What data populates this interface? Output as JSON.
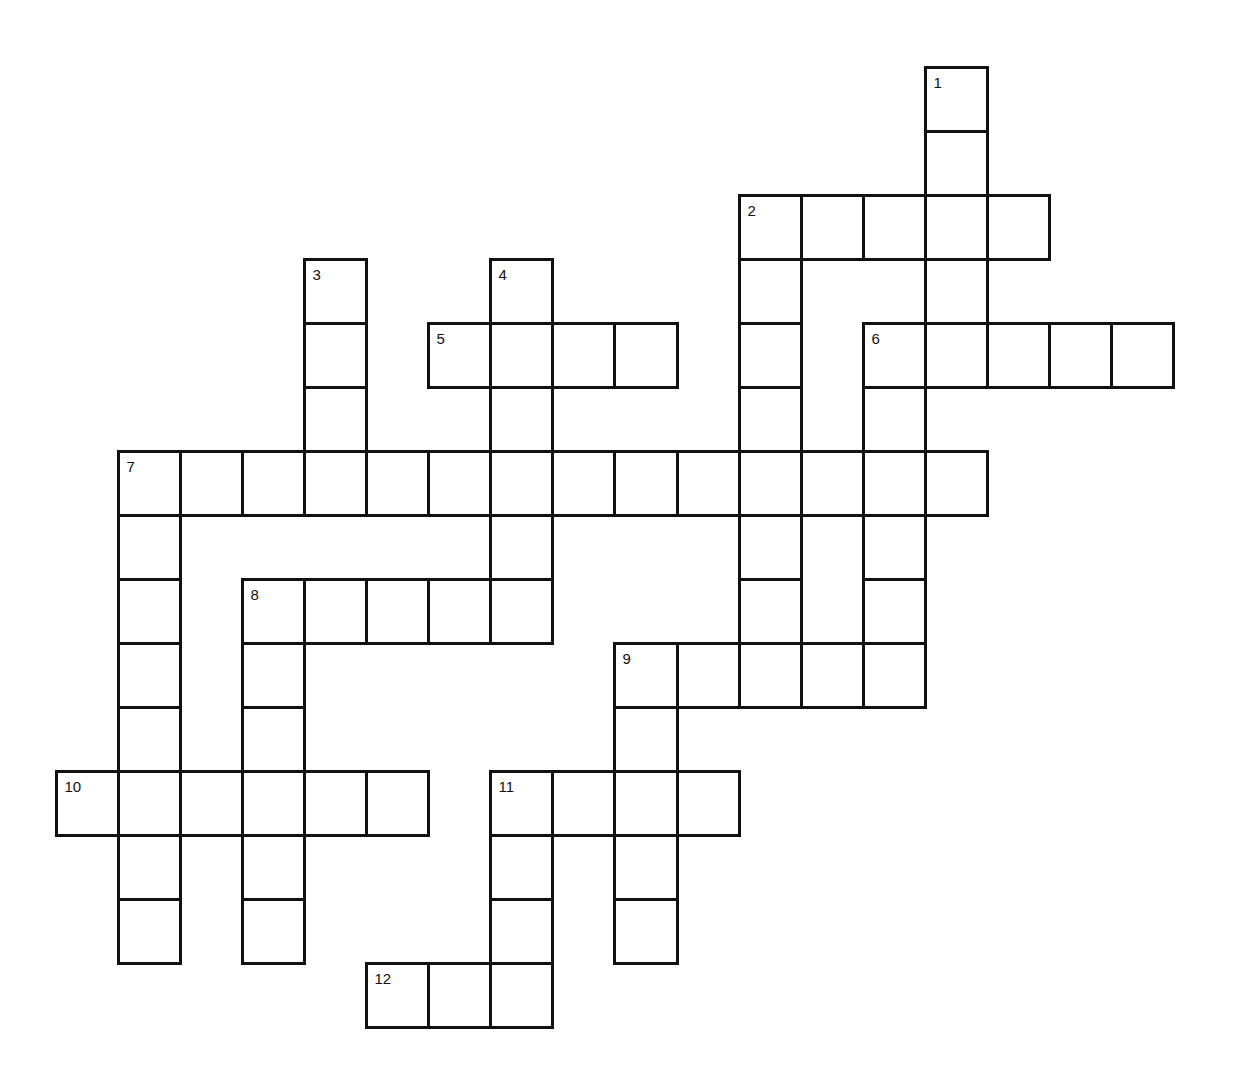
{
  "puzzle": {
    "title": "Crossword",
    "grid": {
      "origin_x": 56,
      "origin_y": 67,
      "cell_w": 62.05,
      "cell_h": 64,
      "cols": 18,
      "rows": 15
    },
    "line_color": "#111111",
    "background": "#ffffff",
    "entries": [
      {
        "number": "1",
        "direction": "down",
        "row": 0,
        "col": 14,
        "length": 5
      },
      {
        "number": "2",
        "direction": "across",
        "row": 2,
        "col": 11,
        "length": 5
      },
      {
        "number": "2",
        "direction": "down",
        "row": 2,
        "col": 11,
        "length": 8
      },
      {
        "number": "3",
        "direction": "down",
        "row": 3,
        "col": 4,
        "length": 4
      },
      {
        "number": "4",
        "direction": "down",
        "row": 3,
        "col": 7,
        "length": 6
      },
      {
        "number": "5",
        "direction": "across",
        "row": 4,
        "col": 6,
        "length": 4
      },
      {
        "number": "6",
        "direction": "across",
        "row": 4,
        "col": 13,
        "length": 5
      },
      {
        "number": "6",
        "direction": "down",
        "row": 4,
        "col": 13,
        "length": 6
      },
      {
        "number": "7",
        "direction": "across",
        "row": 6,
        "col": 1,
        "length": 14
      },
      {
        "number": "7",
        "direction": "down",
        "row": 6,
        "col": 1,
        "length": 8
      },
      {
        "number": "8",
        "direction": "across",
        "row": 8,
        "col": 3,
        "length": 5
      },
      {
        "number": "8",
        "direction": "down",
        "row": 8,
        "col": 3,
        "length": 6
      },
      {
        "number": "9",
        "direction": "across",
        "row": 9,
        "col": 9,
        "length": 5
      },
      {
        "number": "9",
        "direction": "down",
        "row": 9,
        "col": 9,
        "length": 5
      },
      {
        "number": "10",
        "direction": "across",
        "row": 11,
        "col": 0,
        "length": 6
      },
      {
        "number": "11",
        "direction": "across",
        "row": 11,
        "col": 7,
        "length": 4
      },
      {
        "number": "11",
        "direction": "down",
        "row": 11,
        "col": 7,
        "length": 4
      },
      {
        "number": "12",
        "direction": "across",
        "row": 14,
        "col": 5,
        "length": 3
      }
    ],
    "numbered_cells": [
      {
        "label": "1",
        "row": 0,
        "col": 14
      },
      {
        "label": "2",
        "row": 2,
        "col": 11
      },
      {
        "label": "3",
        "row": 3,
        "col": 4
      },
      {
        "label": "4",
        "row": 3,
        "col": 7
      },
      {
        "label": "5",
        "row": 4,
        "col": 6
      },
      {
        "label": "6",
        "row": 4,
        "col": 13
      },
      {
        "label": "7",
        "row": 6,
        "col": 1
      },
      {
        "label": "8",
        "row": 8,
        "col": 3
      },
      {
        "label": "9",
        "row": 9,
        "col": 9
      },
      {
        "label": "10",
        "row": 11,
        "col": 0
      },
      {
        "label": "11",
        "row": 11,
        "col": 7
      },
      {
        "label": "12",
        "row": 14,
        "col": 5
      }
    ],
    "cell_values": {}
  }
}
